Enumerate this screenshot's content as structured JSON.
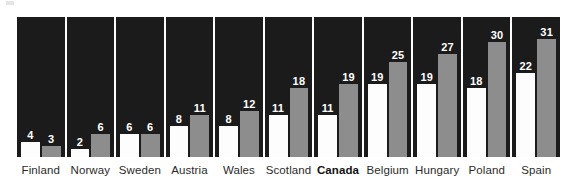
{
  "chart_data": {
    "type": "bar",
    "title": "",
    "subtitle": "",
    "xlabel": "",
    "ylabel": "",
    "ylim": [
      0,
      33
    ],
    "grid": false,
    "legend_position": "none",
    "categories": [
      "Finland",
      "Norway",
      "Sweden",
      "Austria",
      "Wales",
      "Scotland",
      "Canada",
      "Belgium",
      "Hungary",
      "Poland",
      "Spain"
    ],
    "highlighted_category": "Canada",
    "series": [
      {
        "name": "series-white",
        "color": "#fdfdfd",
        "values": [
          4,
          2,
          6,
          8,
          8,
          11,
          11,
          19,
          19,
          18,
          22
        ]
      },
      {
        "name": "series-grey",
        "color": "#8d8d8d",
        "values": [
          3,
          6,
          6,
          11,
          12,
          18,
          19,
          25,
          27,
          30,
          31
        ]
      }
    ],
    "annotations": [
      "Each country panel shows two bars: a white bar and a grey bar, each labelled with its value above the bar.",
      "Panel background is near-black; Canada's axis label is rendered in bold."
    ]
  },
  "style": {
    "panel_background": "#1b1b1b",
    "page_background": "#ffffff",
    "white_bar_color": "#fdfdfd",
    "grey_bar_color": "#8d8d8d",
    "value_label_color": "#ffffff",
    "axis_label_color": "#2b2b2b"
  }
}
